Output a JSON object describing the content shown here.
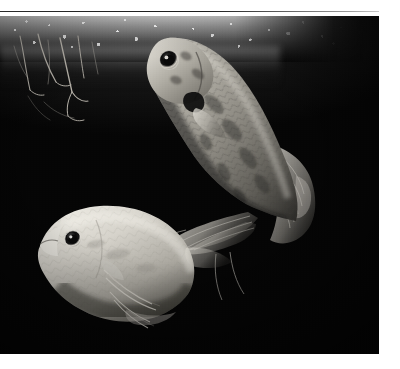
{
  "header": {
    "clipped_text": "rtar",
    "rule_label": "horizontal-rule"
  },
  "photo": {
    "caption": "",
    "alt": "Black and white underwater aquarium photograph of two fish near the water surface",
    "medium": "black-and-white photograph",
    "background_color": "#000000",
    "water_surface_label": "water surface with bubbles and foam",
    "plants_label": "hanging plant roots"
  },
  "subjects": [
    {
      "id": "fish-upper",
      "name": "upper-fish",
      "description": "large mottled fish, head up-left, body curving down-right, long flowing caudal and anal fins",
      "body_tone": "#9a9a94",
      "eye_label": "eye",
      "fin_label": "caudal-fin"
    },
    {
      "id": "fish-lower",
      "name": "lower-fish",
      "description": "pale light-toned gourami, head facing left, rounded body, thin trailing pelvic filaments",
      "body_tone": "#cfcdc6",
      "eye_label": "eye",
      "fin_label": "pelvic-filaments"
    }
  ],
  "colors": {
    "page_background": "#ffffff",
    "photo_background": "#000000",
    "rule": "#222222",
    "header_text": "#7b7b7b",
    "highlight": "#ffffff"
  }
}
